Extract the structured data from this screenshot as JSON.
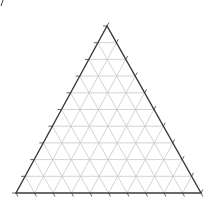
{
  "diagram": {
    "type": "ternary-grid",
    "divisions": 10,
    "vertices": {
      "top": [
        107,
        26
      ],
      "bottom_left": [
        16,
        193
      ],
      "bottom_right": [
        201,
        193
      ]
    },
    "tick_length": 4,
    "colors": {
      "edge": "#3a3a3a",
      "grid": "#c8c8c8",
      "tick": "#555555",
      "background": "#ffffff"
    },
    "labels": []
  }
}
